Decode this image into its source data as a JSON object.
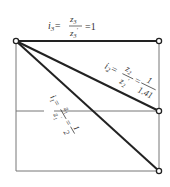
{
  "diagram": {
    "type": "lever-ratio-diagram",
    "colors": {
      "line": "#222222",
      "frame": "#777777",
      "background": "#ffffff"
    },
    "labels": {
      "i3": {
        "lhs": "i",
        "sub": "3",
        "num": "z",
        "num_sub": "3",
        "den": "z",
        "den_sub": "3",
        "den_sup": "'",
        "rhs": "=1"
      },
      "i2": {
        "lhs": "i",
        "sub": "2",
        "num": "z",
        "num_sub": "2",
        "den": "z",
        "den_sub": "2",
        "den_sup": "'",
        "eq": "=",
        "rhs_num": "1",
        "rhs_den": "1.41"
      },
      "i1": {
        "lhs": "i",
        "sub": "1",
        "num": "z",
        "num_sub": "1",
        "den": "z",
        "den_sub": "1",
        "den_sup": "'",
        "eq": "=",
        "rhs_num": "1",
        "rhs_den": "2"
      }
    },
    "nodes": [
      {
        "name": "pivot",
        "x": 16,
        "y": 41
      },
      {
        "name": "end-top",
        "x": 159,
        "y": 41
      },
      {
        "name": "end-middle",
        "x": 159,
        "y": 111
      },
      {
        "name": "end-bottom",
        "x": 159,
        "y": 171
      }
    ]
  }
}
